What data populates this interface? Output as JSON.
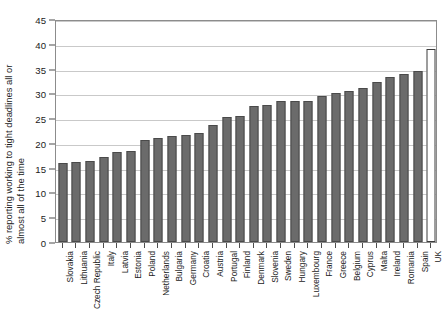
{
  "chart_data": {
    "type": "bar",
    "title": "",
    "subtitle": "",
    "xlabel": "",
    "ylabel": "% reporting working to tight deadlines all or almost all of the time",
    "ylabel_line1": "% reporting working to tight deadlines all or",
    "ylabel_line2": "almost all of the time",
    "ylim": [
      0,
      45
    ],
    "ytick_step": 5,
    "yticks": [
      0,
      5,
      10,
      15,
      20,
      25,
      30,
      35,
      40,
      45
    ],
    "ytick_labels": [
      "0",
      "5",
      "10",
      "15",
      "20",
      "25",
      "30",
      "35",
      "40",
      "45"
    ],
    "grid": true,
    "grid_axis": "y",
    "legend": false,
    "legend_position": "none",
    "bar_color": "#6b6b6b",
    "bar_edge_color": "#4a4a4a",
    "highlight_bar_color": "#ffffff",
    "highlight_bar_edge_color": "#3d3d3d",
    "highlight_category": "UK",
    "grid_color": "#c9c9c9",
    "axis_color": "#8c8c8c",
    "categories": [
      "Slovakia",
      "Lithuania",
      "Czech Republic",
      "Italy",
      "Latvia",
      "Estonia",
      "Poland",
      "Netherlands",
      "Bulgaria",
      "Germany",
      "Croatia",
      "Austria",
      "Portugal",
      "Finland",
      "Denmark",
      "Slovenia",
      "Sweden",
      "Hungary",
      "Luxembourg",
      "France",
      "Greece",
      "Belgium",
      "Cyprus",
      "Malta",
      "Ireland",
      "Romania",
      "Spain",
      "UK"
    ],
    "values": [
      15.9,
      16.2,
      16.4,
      17.2,
      18.2,
      18.3,
      20.5,
      20.9,
      21.5,
      21.7,
      22.0,
      23.7,
      25.2,
      25.4,
      27.5,
      27.6,
      28.4,
      28.4,
      28.5,
      29.4,
      30.0,
      30.4,
      31.1,
      32.3,
      33.3,
      34.0,
      34.6,
      39.0
    ]
  }
}
